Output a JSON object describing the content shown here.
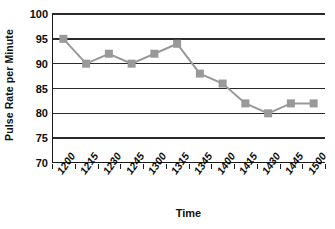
{
  "chart_data": {
    "type": "line",
    "title": "",
    "subtitle": "",
    "xlabel": "Time",
    "ylabel": "Pulse Rate per Minute",
    "categories": [
      "1200",
      "1215",
      "1230",
      "1245",
      "1300",
      "1315",
      "1345",
      "1400",
      "1415",
      "1430",
      "1445",
      "1500"
    ],
    "values": [
      95,
      90,
      92,
      90,
      92,
      94,
      88,
      86,
      82,
      80,
      82,
      82
    ],
    "ylim": [
      70,
      100
    ],
    "yticks": [
      70,
      75,
      80,
      85,
      90,
      95,
      100
    ],
    "ytick_labels": [
      "70",
      "75",
      "80",
      "85",
      "90",
      "95",
      "100"
    ],
    "grid": true,
    "grid_axis": "y",
    "legend": false,
    "legend_position": "none",
    "marker": "square",
    "series_color": "#999999",
    "line_color": "#999999",
    "grid_color": "#2b2b2b",
    "axis_color": "#1a1a1a",
    "background_color": "#ffffff",
    "text_color": "#0c0c0c"
  }
}
